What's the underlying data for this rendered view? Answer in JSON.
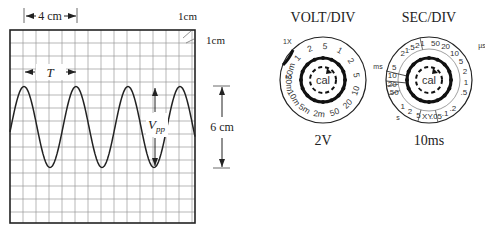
{
  "scope": {
    "grid": {
      "x": 10,
      "y": 30,
      "width": 185,
      "height": 193,
      "cell": 13,
      "color": "#9a9a9a",
      "frame_color": "#222222"
    },
    "waveform": {
      "center_y": 127,
      "amplitude": 40.5,
      "period_px": 52,
      "first_peak_x": 24,
      "color": "#222222"
    },
    "labels": {
      "horizontal_span": "4 cm",
      "corner_h": "1cm",
      "corner_v": "1cm",
      "period": "T",
      "vpp_main": "V",
      "vpp_sub": "pp",
      "vertical_span": "6 cm"
    }
  },
  "volt_div": {
    "title": "VOLT/DIV",
    "value": "2V",
    "probe_label": "1X",
    "center_label": "cal",
    "dial_labels": [
      "50m",
      "1",
      "2",
      "5",
      "1",
      "2",
      "5",
      "10",
      "20",
      "50",
      "2m",
      "5m",
      "10m",
      "20m"
    ]
  },
  "sec_div": {
    "title": "SEC/DIV",
    "value": "10ms",
    "center_label": "cal",
    "unit_us": "µs",
    "unit_ms": "ms",
    "unit_s": "s",
    "top_labels": [
      "2",
      "1",
      ".5",
      ".2",
      ".1"
    ],
    "us_labels": [
      "50",
      "20",
      "10",
      "5",
      "2",
      "1",
      ".5"
    ],
    "ms_labels": [
      "5",
      "10",
      "20",
      "50"
    ],
    "bottom_labels": [
      "1",
      "2",
      "5",
      "XY",
      ".05",
      ".1",
      ".2"
    ]
  }
}
